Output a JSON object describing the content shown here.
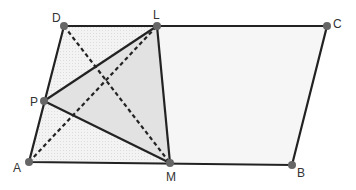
{
  "diagram": {
    "type": "geometry",
    "colors": {
      "line": "#222222",
      "point": "#666666",
      "parallelogram_fill": "#f4f4f4",
      "triangle_fill": "#e4e4e4",
      "label": "#333333"
    },
    "points": {
      "A": {
        "label": "A",
        "x": 29,
        "y": 162
      },
      "B": {
        "label": "B",
        "x": 292,
        "y": 165
      },
      "C": {
        "label": "C",
        "x": 327,
        "y": 26
      },
      "D": {
        "label": "D",
        "x": 64,
        "y": 26
      },
      "L": {
        "label": "L",
        "x": 157,
        "y": 26
      },
      "M": {
        "label": "M",
        "x": 170,
        "y": 163
      },
      "P": {
        "label": "P",
        "x": 44,
        "y": 101
      }
    },
    "solid_segments": [
      "AB",
      "BC",
      "CD",
      "DA",
      "LM",
      "PL",
      "PM"
    ],
    "dashed_segments": [
      "AL",
      "DM"
    ],
    "shaded_polygons": [
      "ADLM",
      "PLM"
    ]
  }
}
